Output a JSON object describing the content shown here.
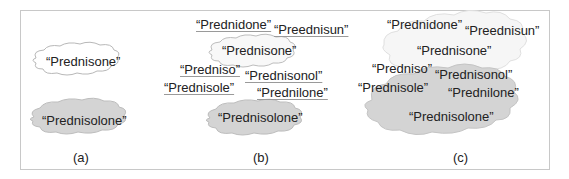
{
  "panels": [
    {
      "label": "(a)",
      "clouds": [
        {
          "name": "prednisone-cloud",
          "fill": "#ffffff",
          "words": [
            "“Prednisone”"
          ]
        },
        {
          "name": "prednisolone-cloud",
          "fill": "#d4d4d4",
          "words": [
            "“Prednisolone”"
          ]
        }
      ]
    },
    {
      "label": "(b)",
      "clouds": [
        {
          "name": "prednisone-cloud",
          "fill": "#ffffff"
        },
        {
          "name": "prednisolone-cloud",
          "fill": "#d4d4d4"
        }
      ],
      "words": [
        {
          "text": "“Prednidone”",
          "misspelled": true
        },
        {
          "text": "“Preednisun”",
          "misspelled": true
        },
        {
          "text": "“Prednisone”",
          "misspelled": false
        },
        {
          "text": "“Predniso”",
          "misspelled": true
        },
        {
          "text": "“Prednisonol”",
          "misspelled": true
        },
        {
          "text": "“Prednisole”",
          "misspelled": true
        },
        {
          "text": "“Prednilone”",
          "misspelled": true
        },
        {
          "text": "“Prednisolone”",
          "misspelled": false
        }
      ]
    },
    {
      "label": "(c)",
      "clouds": [
        {
          "name": "prednisone-cluster-cloud",
          "fill": "#f7f7f7"
        },
        {
          "name": "prednisolone-cluster-cloud",
          "fill": "#d4d4d4"
        }
      ],
      "words": [
        {
          "text": "“Prednidone”",
          "misspelled": true
        },
        {
          "text": "“Preednisun”",
          "misspelled": true
        },
        {
          "text": "“Prednisone”",
          "misspelled": false
        },
        {
          "text": "“Predniso”",
          "misspelled": true
        },
        {
          "text": "“Prednisonol”",
          "misspelled": true
        },
        {
          "text": "“Prednisole”",
          "misspelled": true
        },
        {
          "text": "“Prednilone”",
          "misspelled": true
        },
        {
          "text": "“Prednisolone”",
          "misspelled": false
        }
      ]
    }
  ]
}
